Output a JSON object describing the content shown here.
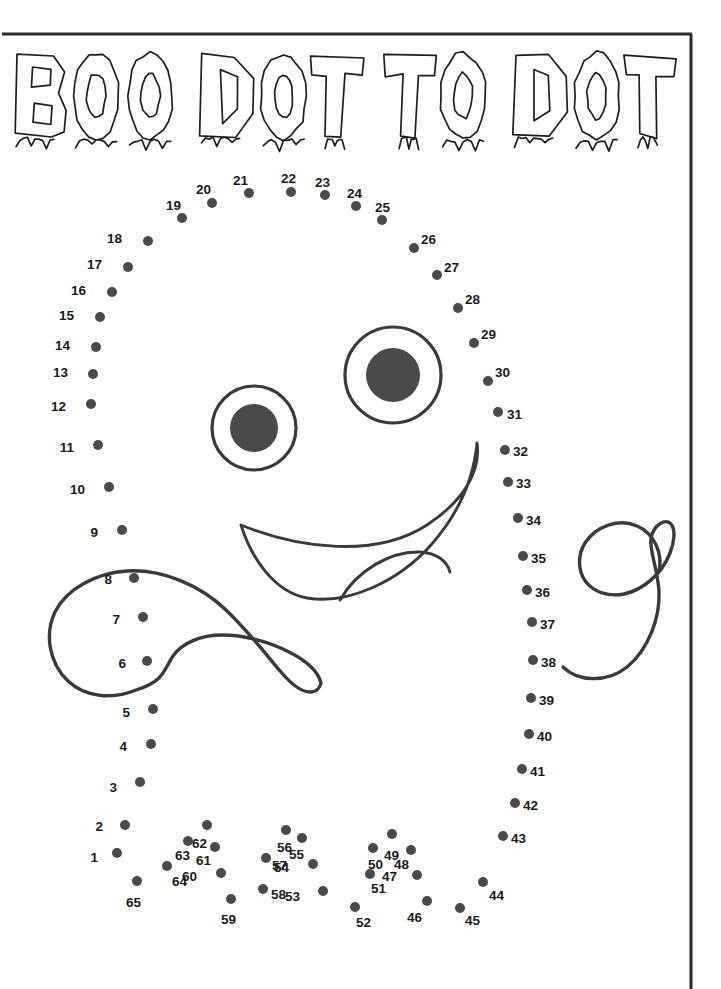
{
  "page": {
    "width": 721,
    "height": 989,
    "background_color": "#ffffff",
    "ink_color": "#3a3a3a",
    "dot_color": "#4a4a4a",
    "label_color": "#1a1a1a",
    "puzzle_type": "connect-the-dots",
    "dot_count": 65
  },
  "title": {
    "text": "BOO DOT TO DOT",
    "words": [
      "BOO",
      "DOT",
      "TO",
      "DOT"
    ],
    "letters": [
      "B",
      "O",
      "O",
      "D",
      "O",
      "T",
      "T",
      "O",
      "D",
      "O",
      "T"
    ],
    "style": "dripping-outline-horror",
    "x": 15,
    "y": 55,
    "width": 660,
    "height": 105
  },
  "frame": {
    "top_line": {
      "x1": 2,
      "y1": 34,
      "x2": 692,
      "y2": 34
    },
    "right_line": {
      "x1": 691,
      "y1": 34,
      "x2": 691,
      "y2": 989
    },
    "stroke_width": 3,
    "color": "#2b2b2b"
  },
  "face": {
    "left_eye": {
      "cx": 254,
      "cy": 428,
      "r_outer": 42,
      "r_pupil": 24
    },
    "right_eye": {
      "cx": 393,
      "cy": 375,
      "r_outer": 48,
      "r_pupil": 27
    },
    "mouth_path": "M 241 525 C 300 549 376 558 427 525 C 465 500 481 470 477 443 C 474 475 461 511 431 545 C 398 582 347 605 307 598 C 275 592 252 560 241 525 Z",
    "tongue_path": "M 340 600 C 357 570 391 551 420 552 C 437 553 447 561 450 572"
  },
  "arms": {
    "left_blob_path": "M 136 690 C 112 700 85 697 68 681 C 48 662 45 633 55 612 C 67 588 97 573 127 571 C 162 569 200 585 226 610 C 250 633 268 657 281 672 C 292 685 302 692 310 692 C 316 692 320 688 321 683 C 318 671 305 660 289 652 C 268 641 243 635 222 635 C 201 635 182 643 173 656 C 164 669 165 681 136 690 Z",
    "right_blob_path": "M 563 667 C 578 682 607 683 627 667 C 649 649 660 617 659 592 C 658 569 649 551 651 538 C 654 524 666 518 671 524 C 676 530 674 543 670 553 C 662 574 643 590 624 594 C 608 597 594 592 586 582 C 577 570 578 554 585 543 C 596 526 619 518 637 526 C 654 533 663 553 659 572"
  },
  "dots": [
    {
      "n": 1,
      "cx": 117,
      "cy": 853,
      "lx": 98,
      "ly": 858,
      "side": "left"
    },
    {
      "n": 2,
      "cx": 125,
      "cy": 825,
      "lx": 103,
      "ly": 827,
      "side": "left"
    },
    {
      "n": 3,
      "cx": 140,
      "cy": 782,
      "lx": 117,
      "ly": 788,
      "side": "left"
    },
    {
      "n": 4,
      "cx": 151,
      "cy": 744,
      "lx": 127,
      "ly": 747,
      "side": "left"
    },
    {
      "n": 5,
      "cx": 153,
      "cy": 709,
      "lx": 130,
      "ly": 713,
      "side": "left"
    },
    {
      "n": 6,
      "cx": 147,
      "cy": 661,
      "lx": 126,
      "ly": 664,
      "side": "left"
    },
    {
      "n": 7,
      "cx": 143,
      "cy": 617,
      "lx": 120,
      "ly": 620,
      "side": "left"
    },
    {
      "n": 8,
      "cx": 134,
      "cy": 578,
      "lx": 112,
      "ly": 580,
      "side": "left"
    },
    {
      "n": 9,
      "cx": 122,
      "cy": 530,
      "lx": 98,
      "ly": 533,
      "side": "left"
    },
    {
      "n": 10,
      "cx": 109,
      "cy": 487,
      "lx": 85,
      "ly": 490,
      "side": "left"
    },
    {
      "n": 11,
      "cx": 98,
      "cy": 445,
      "lx": 74,
      "ly": 448,
      "side": "left"
    },
    {
      "n": 12,
      "cx": 91,
      "cy": 404,
      "lx": 66,
      "ly": 407,
      "side": "left"
    },
    {
      "n": 13,
      "cx": 93,
      "cy": 374,
      "lx": 68,
      "ly": 373,
      "side": "left"
    },
    {
      "n": 14,
      "cx": 96,
      "cy": 347,
      "lx": 70,
      "ly": 346,
      "side": "left"
    },
    {
      "n": 15,
      "cx": 100,
      "cy": 317,
      "lx": 74,
      "ly": 316,
      "side": "left"
    },
    {
      "n": 16,
      "cx": 112,
      "cy": 292,
      "lx": 86,
      "ly": 291,
      "side": "left"
    },
    {
      "n": 17,
      "cx": 128,
      "cy": 267,
      "lx": 102,
      "ly": 265,
      "side": "left"
    },
    {
      "n": 18,
      "cx": 148,
      "cy": 241,
      "lx": 122,
      "ly": 239,
      "side": "left"
    },
    {
      "n": 19,
      "cx": 182,
      "cy": 218,
      "lx": 166,
      "ly": 206,
      "side": "above"
    },
    {
      "n": 20,
      "cx": 212,
      "cy": 203,
      "lx": 196,
      "ly": 190,
      "side": "above"
    },
    {
      "n": 21,
      "cx": 249,
      "cy": 193,
      "lx": 233,
      "ly": 181,
      "side": "above"
    },
    {
      "n": 22,
      "cx": 291,
      "cy": 192,
      "lx": 281,
      "ly": 179,
      "side": "above"
    },
    {
      "n": 23,
      "cx": 325,
      "cy": 195,
      "lx": 315,
      "ly": 183,
      "side": "above"
    },
    {
      "n": 24,
      "cx": 356,
      "cy": 206,
      "lx": 347,
      "ly": 194,
      "side": "above"
    },
    {
      "n": 25,
      "cx": 382,
      "cy": 220,
      "lx": 375,
      "ly": 208,
      "side": "above"
    },
    {
      "n": 26,
      "cx": 414,
      "cy": 248,
      "lx": 421,
      "ly": 240,
      "side": "right"
    },
    {
      "n": 27,
      "cx": 437,
      "cy": 275,
      "lx": 444,
      "ly": 268,
      "side": "right"
    },
    {
      "n": 28,
      "cx": 458,
      "cy": 308,
      "lx": 465,
      "ly": 300,
      "side": "right"
    },
    {
      "n": 29,
      "cx": 474,
      "cy": 343,
      "lx": 481,
      "ly": 335,
      "side": "right"
    },
    {
      "n": 30,
      "cx": 488,
      "cy": 381,
      "lx": 495,
      "ly": 373,
      "side": "right"
    },
    {
      "n": 31,
      "cx": 498,
      "cy": 412,
      "lx": 507,
      "ly": 415,
      "side": "right"
    },
    {
      "n": 32,
      "cx": 505,
      "cy": 450,
      "lx": 513,
      "ly": 452,
      "side": "right"
    },
    {
      "n": 33,
      "cx": 508,
      "cy": 482,
      "lx": 516,
      "ly": 484,
      "side": "right"
    },
    {
      "n": 34,
      "cx": 518,
      "cy": 518,
      "lx": 526,
      "ly": 521,
      "side": "right"
    },
    {
      "n": 35,
      "cx": 523,
      "cy": 556,
      "lx": 531,
      "ly": 559,
      "side": "right"
    },
    {
      "n": 36,
      "cx": 527,
      "cy": 590,
      "lx": 535,
      "ly": 593,
      "side": "right"
    },
    {
      "n": 37,
      "cx": 532,
      "cy": 622,
      "lx": 540,
      "ly": 625,
      "side": "right"
    },
    {
      "n": 38,
      "cx": 533,
      "cy": 660,
      "lx": 541,
      "ly": 663,
      "side": "right"
    },
    {
      "n": 39,
      "cx": 531,
      "cy": 698,
      "lx": 539,
      "ly": 701,
      "side": "right"
    },
    {
      "n": 40,
      "cx": 529,
      "cy": 734,
      "lx": 537,
      "ly": 737,
      "side": "right"
    },
    {
      "n": 41,
      "cx": 522,
      "cy": 769,
      "lx": 530,
      "ly": 772,
      "side": "right"
    },
    {
      "n": 42,
      "cx": 515,
      "cy": 803,
      "lx": 523,
      "ly": 806,
      "side": "right"
    },
    {
      "n": 43,
      "cx": 503,
      "cy": 836,
      "lx": 511,
      "ly": 839,
      "side": "right"
    },
    {
      "n": 44,
      "cx": 483,
      "cy": 882,
      "lx": 489,
      "ly": 896,
      "side": "below"
    },
    {
      "n": 45,
      "cx": 460,
      "cy": 908,
      "lx": 465,
      "ly": 921,
      "side": "below"
    },
    {
      "n": 46,
      "cx": 427,
      "cy": 901,
      "lx": 407,
      "ly": 918,
      "side": "below"
    },
    {
      "n": 47,
      "cx": 417,
      "cy": 875,
      "lx": 397,
      "ly": 877,
      "side": "left"
    },
    {
      "n": 48,
      "cx": 411,
      "cy": 850,
      "lx": 394,
      "ly": 865,
      "side": "below"
    },
    {
      "n": 49,
      "cx": 392,
      "cy": 834,
      "lx": 384,
      "ly": 856,
      "side": "below"
    },
    {
      "n": 50,
      "cx": 373,
      "cy": 848,
      "lx": 368,
      "ly": 865,
      "side": "below"
    },
    {
      "n": 51,
      "cx": 370,
      "cy": 874,
      "lx": 371,
      "ly": 889,
      "side": "below"
    },
    {
      "n": 52,
      "cx": 355,
      "cy": 907,
      "lx": 356,
      "ly": 923,
      "side": "below"
    },
    {
      "n": 53,
      "cx": 323,
      "cy": 891,
      "lx": 300,
      "ly": 897,
      "side": "left"
    },
    {
      "n": 54,
      "cx": 313,
      "cy": 864,
      "lx": 289,
      "ly": 868,
      "side": "left"
    },
    {
      "n": 55,
      "cx": 302,
      "cy": 838,
      "lx": 289,
      "ly": 855,
      "side": "below"
    },
    {
      "n": 56,
      "cx": 286,
      "cy": 830,
      "lx": 277,
      "ly": 848,
      "side": "below"
    },
    {
      "n": 57,
      "cx": 266,
      "cy": 858,
      "lx": 272,
      "ly": 866,
      "side": "right"
    },
    {
      "n": 58,
      "cx": 263,
      "cy": 889,
      "lx": 271,
      "ly": 895,
      "side": "right"
    },
    {
      "n": 59,
      "cx": 231,
      "cy": 899,
      "lx": 221,
      "ly": 920,
      "side": "below"
    },
    {
      "n": 60,
      "cx": 221,
      "cy": 873,
      "lx": 197,
      "ly": 877,
      "side": "left"
    },
    {
      "n": 61,
      "cx": 215,
      "cy": 847,
      "lx": 196,
      "ly": 861,
      "side": "below"
    },
    {
      "n": 62,
      "cx": 207,
      "cy": 825,
      "lx": 192,
      "ly": 844,
      "side": "below"
    },
    {
      "n": 63,
      "cx": 188,
      "cy": 841,
      "lx": 175,
      "ly": 856,
      "side": "below"
    },
    {
      "n": 64,
      "cx": 167,
      "cy": 866,
      "lx": 172,
      "ly": 882,
      "side": "below"
    },
    {
      "n": 65,
      "cx": 137,
      "cy": 881,
      "lx": 126,
      "ly": 903,
      "side": "below"
    }
  ]
}
